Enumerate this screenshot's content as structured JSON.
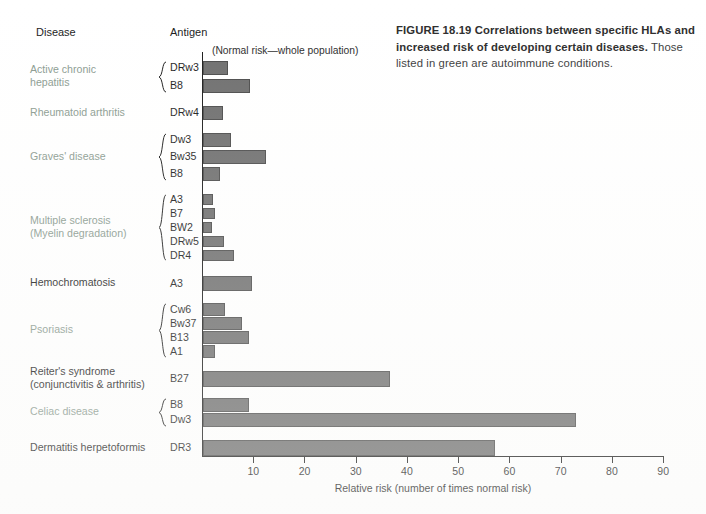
{
  "caption": {
    "figure_number": "FIGURE 18.19",
    "title": "Correlations between specific HLAs and increased risk of developing certain diseases.",
    "rest": " Those listed in green are autoimmune conditions."
  },
  "headers": {
    "disease": "Disease",
    "antigen": "Antigen",
    "normal_risk_note": "(Normal risk—whole population)"
  },
  "colors": {
    "bar_fill": "#6e6e6e",
    "bar_stroke": "#4a4a4a",
    "autoimmune_label": "#8a9a8f",
    "normal_label": "#1a1a1a",
    "axis": "#1a1a1a"
  },
  "chart_data": {
    "type": "bar",
    "orientation": "horizontal",
    "title": "Correlations between specific HLAs and increased risk of developing certain diseases",
    "xlabel": "Relative risk (number of times normal risk)",
    "ylabel": "",
    "xlim": [
      0,
      90
    ],
    "xticks": [
      10,
      20,
      30,
      40,
      50,
      60,
      70,
      80,
      90
    ],
    "grid": false,
    "legend": null,
    "note": "(Normal risk—whole population)",
    "groups": [
      {
        "disease": "Active chronic\nhepatitis",
        "autoimmune": true,
        "bars": [
          {
            "antigen": "DRw3",
            "value": 4.9
          },
          {
            "antigen": "B8",
            "value": 9.2
          }
        ]
      },
      {
        "disease": "Rheumatoid arthritis",
        "autoimmune": true,
        "bars": [
          {
            "antigen": "DRw4",
            "value": 3.9
          }
        ]
      },
      {
        "disease": "Graves' disease",
        "autoimmune": true,
        "bars": [
          {
            "antigen": "Dw3",
            "value": 5.5
          },
          {
            "antigen": "Bw35",
            "value": 12.3
          },
          {
            "antigen": "B8",
            "value": 3.3
          }
        ]
      },
      {
        "disease": "Multiple sclerosis\n(Myelin degradation)",
        "autoimmune": true,
        "bars": [
          {
            "antigen": "A3",
            "value": 2.0
          },
          {
            "antigen": "B7",
            "value": 2.3
          },
          {
            "antigen": "BW2",
            "value": 1.8
          },
          {
            "antigen": "DRw5",
            "value": 4.1
          },
          {
            "antigen": "DR4",
            "value": 6.1
          }
        ]
      },
      {
        "disease": "Hemochromatosis",
        "autoimmune": false,
        "bars": [
          {
            "antigen": "A3",
            "value": 9.6
          }
        ]
      },
      {
        "disease": "Psoriasis",
        "autoimmune": true,
        "bars": [
          {
            "antigen": "Cw6",
            "value": 4.3
          },
          {
            "antigen": "Bw37",
            "value": 7.6
          },
          {
            "antigen": "B13",
            "value": 9.0
          },
          {
            "antigen": "A1",
            "value": 2.3
          }
        ]
      },
      {
        "disease": "Reiter's syndrome\n(conjunctivitis & arthritis)",
        "autoimmune": false,
        "bars": [
          {
            "antigen": "B27",
            "value": 36.4
          }
        ]
      },
      {
        "disease": "Celiac disease",
        "autoimmune": true,
        "bars": [
          {
            "antigen": "B8",
            "value": 9.0
          },
          {
            "antigen": "Dw3",
            "value": 72.8
          }
        ]
      },
      {
        "disease": "Dermatitis herpetoformis",
        "autoimmune": false,
        "bars": [
          {
            "antigen": "DR3",
            "value": 56.9
          }
        ]
      },
      {
        "disease": "Ankylosing spondylitis\n(arthritis of spine)",
        "autoimmune": false,
        "bars": [
          {
            "antigen": "B27",
            "value": 88.4
          }
        ]
      }
    ]
  },
  "layout": {
    "axis_x0": 202,
    "axis_y_top": 52,
    "axis_y_bottom": 456,
    "px_per_unit": 5.124,
    "row_positions": [
      {
        "top": 61,
        "height": 14
      },
      {
        "top": 79,
        "height": 14
      },
      {
        "top": 106,
        "height": 14
      },
      {
        "top": 133,
        "height": 14
      },
      {
        "top": 150,
        "height": 14
      },
      {
        "top": 167,
        "height": 14
      },
      {
        "top": 194,
        "height": 11
      },
      {
        "top": 208,
        "height": 11
      },
      {
        "top": 222,
        "height": 11
      },
      {
        "top": 236,
        "height": 11
      },
      {
        "top": 250,
        "height": 11
      },
      {
        "top": 276,
        "height": 15
      },
      {
        "top": 303,
        "height": 13
      },
      {
        "top": 317,
        "height": 13
      },
      {
        "top": 331,
        "height": 13
      },
      {
        "top": 345,
        "height": 13
      },
      {
        "top": 371,
        "height": 16
      },
      {
        "top": 398,
        "height": 14
      },
      {
        "top": 413,
        "height": 14
      },
      {
        "top": 440,
        "height": 16
      }
    ]
  }
}
